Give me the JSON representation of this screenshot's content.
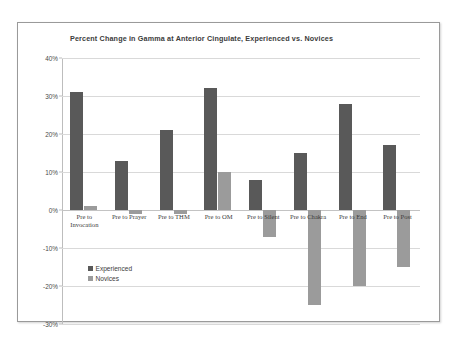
{
  "chart_data": {
    "type": "bar",
    "title": "Percent Change in Gamma at Anterior Cingulate, Experienced vs. Novices",
    "xlabel": "",
    "ylabel": "",
    "ylim": [
      -30,
      40
    ],
    "ytick_labels": [
      "40%",
      "30%",
      "20%",
      "10%",
      "0%",
      "-10%",
      "-20%",
      "-30%"
    ],
    "ytick_values": [
      40,
      30,
      20,
      10,
      0,
      -10,
      -20,
      -30
    ],
    "grid": true,
    "legend_position": "inside-left",
    "categories": [
      "Pre to\nInvocation",
      "Pre to Prayer",
      "Pre to THM",
      "Pre to OM",
      "Pre to Silent",
      "Pre to Chakra",
      "Pre to End",
      "Pre to Post"
    ],
    "series": [
      {
        "name": "Experienced",
        "color": "#595959",
        "values": [
          31,
          13,
          21,
          32,
          8,
          15,
          28,
          17
        ]
      },
      {
        "name": "Novices",
        "color": "#9b9b9b",
        "values": [
          1,
          -1,
          -1,
          10,
          -7,
          -25,
          -20,
          -15
        ]
      }
    ]
  },
  "legend": {
    "items": [
      {
        "label": "Experienced",
        "color": "#595959"
      },
      {
        "label": "Novices",
        "color": "#9b9b9b"
      }
    ]
  }
}
